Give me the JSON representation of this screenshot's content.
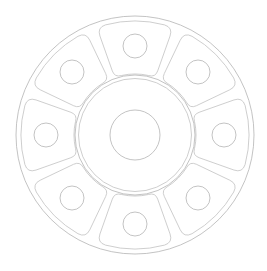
{
  "canvas": {
    "width": 267,
    "height": 271,
    "background_color": "#ffffff",
    "title": "Spoked Flange Hub - Plan View"
  },
  "style": {
    "line_color": "#c2c2c2",
    "line_color_strong": "#b4b4b4",
    "line_width": 0.8,
    "fill": "none"
  },
  "geometry": {
    "center": {
      "x": 135,
      "y": 135
    },
    "outer_rim": {
      "name": "outer-rim-circle",
      "radius": 119
    },
    "hub": {
      "name": "hub-ring",
      "outer_radius": 60,
      "inner_radius": 56.5
    },
    "bore": {
      "name": "center-bore-circle",
      "radius": 25
    },
    "spokes": {
      "name": "spoke-sectors",
      "count": 8,
      "angular_pitch_deg": 45,
      "half_span_deg": 19.5,
      "inner_radius": 61,
      "outer_radius": 114,
      "corner_fillet_inner": 7,
      "corner_fillet_outer": 9,
      "start_angle_deg": -90
    },
    "bolt_holes": {
      "name": "bolt-hole-circles",
      "count": 8,
      "radius": 12,
      "bolt_circle_radius": 89,
      "start_angle_deg": -90,
      "centers": [
        {
          "label": "hole-1-top",
          "angle_deg": -90,
          "x": 135,
          "y": 46
        },
        {
          "label": "hole-2-top-right",
          "angle_deg": -45,
          "x": 198,
          "y": 72
        },
        {
          "label": "hole-3-right",
          "angle_deg": 0,
          "x": 224,
          "y": 135
        },
        {
          "label": "hole-4-bottom-right",
          "angle_deg": 45,
          "x": 198,
          "y": 198
        },
        {
          "label": "hole-5-bottom",
          "angle_deg": 90,
          "x": 135,
          "y": 224
        },
        {
          "label": "hole-6-bottom-left",
          "angle_deg": 135,
          "x": 72,
          "y": 198
        },
        {
          "label": "hole-7-left",
          "angle_deg": 180,
          "x": 46,
          "y": 135
        },
        {
          "label": "hole-8-top-left",
          "angle_deg": -135,
          "x": 72,
          "y": 72
        }
      ]
    }
  }
}
